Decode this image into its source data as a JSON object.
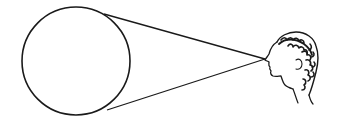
{
  "diagram": {
    "colors": {
      "stroke": "#1a1a1a",
      "background": "#ffffff"
    },
    "circle": {
      "cx": 76,
      "cy": 61,
      "r": 54
    },
    "eye_point": {
      "x": 265,
      "y": 59
    },
    "tangent_top": {
      "x1": 104,
      "y1": 14,
      "x2": 265,
      "y2": 59
    },
    "tangent_bottom": {
      "x1": 107,
      "y1": 110,
      "x2": 265,
      "y2": 59
    },
    "head": {
      "label": "classical-profile-head",
      "x": 266,
      "y": 34,
      "width": 56,
      "height": 72
    }
  }
}
